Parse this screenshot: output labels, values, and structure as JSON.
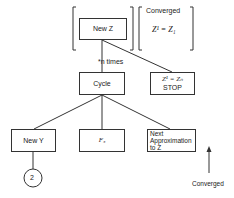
{
  "diagram": {
    "top_left_bracket": {
      "box_label": "New Z"
    },
    "top_right_bracket": {
      "header": "Converged",
      "equation": "Z¹ = Z₁"
    },
    "edge_label": "*n times",
    "cycle": "Cycle",
    "stop_box": {
      "equation": "Z¹ = Zₙ",
      "label": "STOP"
    },
    "children": [
      {
        "label": "New Y"
      },
      {
        "label": "F₃"
      },
      {
        "label": "Next Approximation to Z"
      }
    ],
    "connector": "2",
    "arrow_label": "Converged"
  }
}
